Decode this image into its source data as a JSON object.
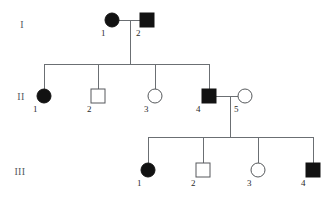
{
  "figure": {
    "type": "pedigree-chart",
    "title": "",
    "symbol_key": {
      "filled": "affected",
      "open": "unaffected",
      "circle": "female",
      "square": "male"
    },
    "colors": {
      "affected_fill": "#121212",
      "unaffected_fill": "#ffffff",
      "symbol_stroke": "#56595c",
      "line_stroke": "#6b6f73",
      "label_text": "#2a2a2a",
      "generation_text": "#555a5e",
      "background": "#ffffff"
    }
  },
  "generations": [
    {
      "label": "I",
      "label_x": 22,
      "label_y": 28,
      "row_y": 20
    },
    {
      "label": "II",
      "label_x": 21,
      "label_y": 100,
      "row_y": 96
    },
    {
      "label": "III",
      "label_x": 20,
      "label_y": 175,
      "row_y": 170
    }
  ],
  "individuals": [
    {
      "id": "I-1",
      "generation": "I",
      "number": "1",
      "sex": "female",
      "affected": true,
      "cx": 112,
      "cy": 20,
      "r": 7,
      "num_x": 101,
      "num_y": 36
    },
    {
      "id": "I-2",
      "generation": "I",
      "number": "2",
      "sex": "male",
      "affected": true,
      "cx": 147,
      "cy": 20,
      "r": 7,
      "num_x": 136,
      "num_y": 36
    },
    {
      "id": "II-1",
      "generation": "II",
      "number": "1",
      "sex": "female",
      "affected": true,
      "cx": 44,
      "cy": 96,
      "r": 7,
      "num_x": 33,
      "num_y": 112
    },
    {
      "id": "II-2",
      "generation": "II",
      "number": "2",
      "sex": "male",
      "affected": false,
      "cx": 98,
      "cy": 96,
      "r": 7,
      "num_x": 87,
      "num_y": 112
    },
    {
      "id": "II-3",
      "generation": "II",
      "number": "3",
      "sex": "female",
      "affected": false,
      "cx": 155,
      "cy": 96,
      "r": 7,
      "num_x": 144,
      "num_y": 112
    },
    {
      "id": "II-4",
      "generation": "II",
      "number": "4",
      "sex": "male",
      "affected": true,
      "cx": 209,
      "cy": 96,
      "r": 7,
      "num_x": 196,
      "num_y": 112
    },
    {
      "id": "II-5",
      "generation": "II",
      "number": "5",
      "sex": "female",
      "affected": false,
      "cx": 245,
      "cy": 96,
      "r": 7,
      "num_x": 234,
      "num_y": 112
    },
    {
      "id": "III-1",
      "generation": "III",
      "number": "1",
      "sex": "female",
      "affected": true,
      "cx": 148,
      "cy": 170,
      "r": 7,
      "num_x": 137,
      "num_y": 186
    },
    {
      "id": "III-2",
      "generation": "III",
      "number": "2",
      "sex": "male",
      "affected": false,
      "cx": 203,
      "cy": 170,
      "r": 7,
      "num_x": 191,
      "num_y": 186
    },
    {
      "id": "III-3",
      "generation": "III",
      "number": "3",
      "sex": "female",
      "affected": false,
      "cx": 258,
      "cy": 170,
      "r": 7,
      "num_x": 247,
      "num_y": 186
    },
    {
      "id": "III-4",
      "generation": "III",
      "number": "4",
      "sex": "male",
      "affected": true,
      "cx": 313,
      "cy": 170,
      "r": 7,
      "num_x": 301,
      "num_y": 186
    }
  ],
  "matings": [
    {
      "id": "mating-I",
      "partners": [
        "I-1",
        "I-2"
      ],
      "line_y": 20,
      "x1": 119,
      "x2": 140,
      "descent_x": 130,
      "descent_y2": 64
    },
    {
      "id": "mating-II",
      "partners": [
        "II-4",
        "II-5"
      ],
      "line_y": 96,
      "x1": 216,
      "x2": 238,
      "descent_x": 230,
      "descent_y2": 137
    }
  ],
  "sibships": [
    {
      "id": "sibship-II",
      "parents": "mating-I",
      "bar_y": 64,
      "bar_x1": 44,
      "bar_x2": 209,
      "children": [
        "II-1",
        "II-2",
        "II-3",
        "II-4"
      ],
      "drop_y2": 89
    },
    {
      "id": "sibship-III",
      "parents": "mating-II",
      "bar_y": 137,
      "bar_x1": 148,
      "bar_x2": 313,
      "children": [
        "III-1",
        "III-2",
        "III-3",
        "III-4"
      ],
      "drop_y2": 163
    }
  ]
}
